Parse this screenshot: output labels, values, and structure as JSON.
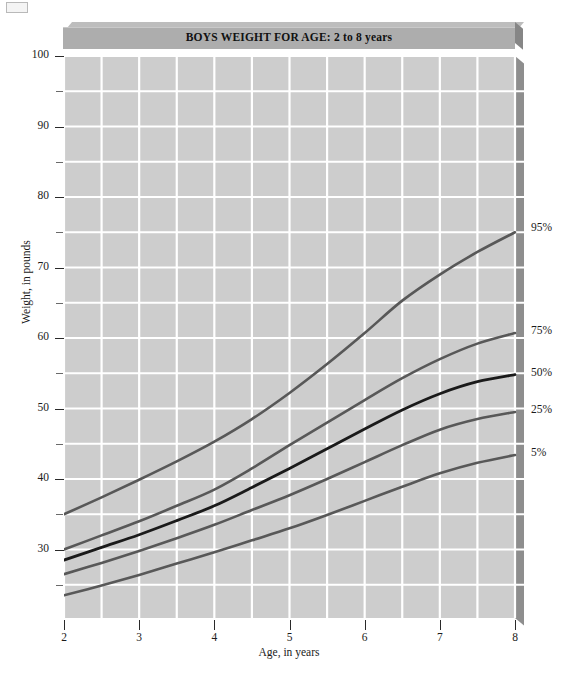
{
  "chart_data": {
    "type": "line",
    "title": "BOYS WEIGHT FOR AGE: 2 to 8 years",
    "xlabel": "Age, in years",
    "ylabel": "Weight, in pounds",
    "xlim": [
      2,
      8
    ],
    "ylim": [
      22,
      100
    ],
    "grid": true,
    "grid_color": "#ffffff",
    "plot_bg": "#cdcdcd",
    "legend_position": "right-of-curve-ends",
    "x_ticks": [
      2,
      3,
      4,
      5,
      6,
      7,
      8
    ],
    "x_tick_labels": [
      "2",
      "3",
      "4",
      "5",
      "6",
      "7",
      "8"
    ],
    "x_minor_gridlines": [
      2.5,
      3.5,
      4.5,
      5.5,
      6.5,
      7.5
    ],
    "y_ticks_major": [
      30,
      40,
      50,
      60,
      70,
      80,
      90,
      100
    ],
    "y_tick_labels": [
      "30",
      "40",
      "50",
      "60",
      "70",
      "80",
      "90",
      "100"
    ],
    "y_ticks_minor": [
      25,
      35,
      45,
      55,
      65,
      75,
      85,
      95
    ],
    "x": [
      2,
      2.5,
      3,
      3.5,
      4,
      4.5,
      5,
      5.5,
      6,
      6.5,
      7,
      7.5,
      8
    ],
    "series": [
      {
        "name": "95%",
        "label": "95%",
        "color": "#585858",
        "width": 2.6,
        "values": [
          35.0,
          37.4,
          39.9,
          42.5,
          45.3,
          48.5,
          52.2,
          56.3,
          60.7,
          65.3,
          69.0,
          72.2,
          75.0
        ]
      },
      {
        "name": "75%",
        "label": "75%",
        "color": "#585858",
        "width": 2.6,
        "values": [
          30.0,
          32.0,
          34.0,
          36.2,
          38.5,
          41.5,
          44.8,
          48.0,
          51.2,
          54.3,
          57.0,
          59.2,
          60.7
        ]
      },
      {
        "name": "50%",
        "label": "50%",
        "color": "#1a1a1a",
        "width": 2.8,
        "values": [
          28.5,
          30.3,
          32.1,
          34.1,
          36.2,
          38.8,
          41.5,
          44.3,
          47.1,
          49.8,
          52.1,
          53.8,
          54.8
        ]
      },
      {
        "name": "25%",
        "label": "25%",
        "color": "#585858",
        "width": 2.6,
        "values": [
          26.5,
          28.1,
          29.8,
          31.6,
          33.5,
          35.6,
          37.7,
          40.0,
          42.4,
          44.8,
          47.0,
          48.5,
          49.5
        ]
      },
      {
        "name": "5%",
        "label": "5%",
        "color": "#585858",
        "width": 2.6,
        "values": [
          23.5,
          24.9,
          26.4,
          28.0,
          29.6,
          31.3,
          33.0,
          34.9,
          36.9,
          38.9,
          40.8,
          42.3,
          43.4
        ]
      }
    ]
  },
  "chart": {
    "title": "BOYS WEIGHT FOR AGE: 2 to 8 years",
    "x_axis_title": "Age, in years",
    "y_axis_title": "Weight, in pounds"
  }
}
